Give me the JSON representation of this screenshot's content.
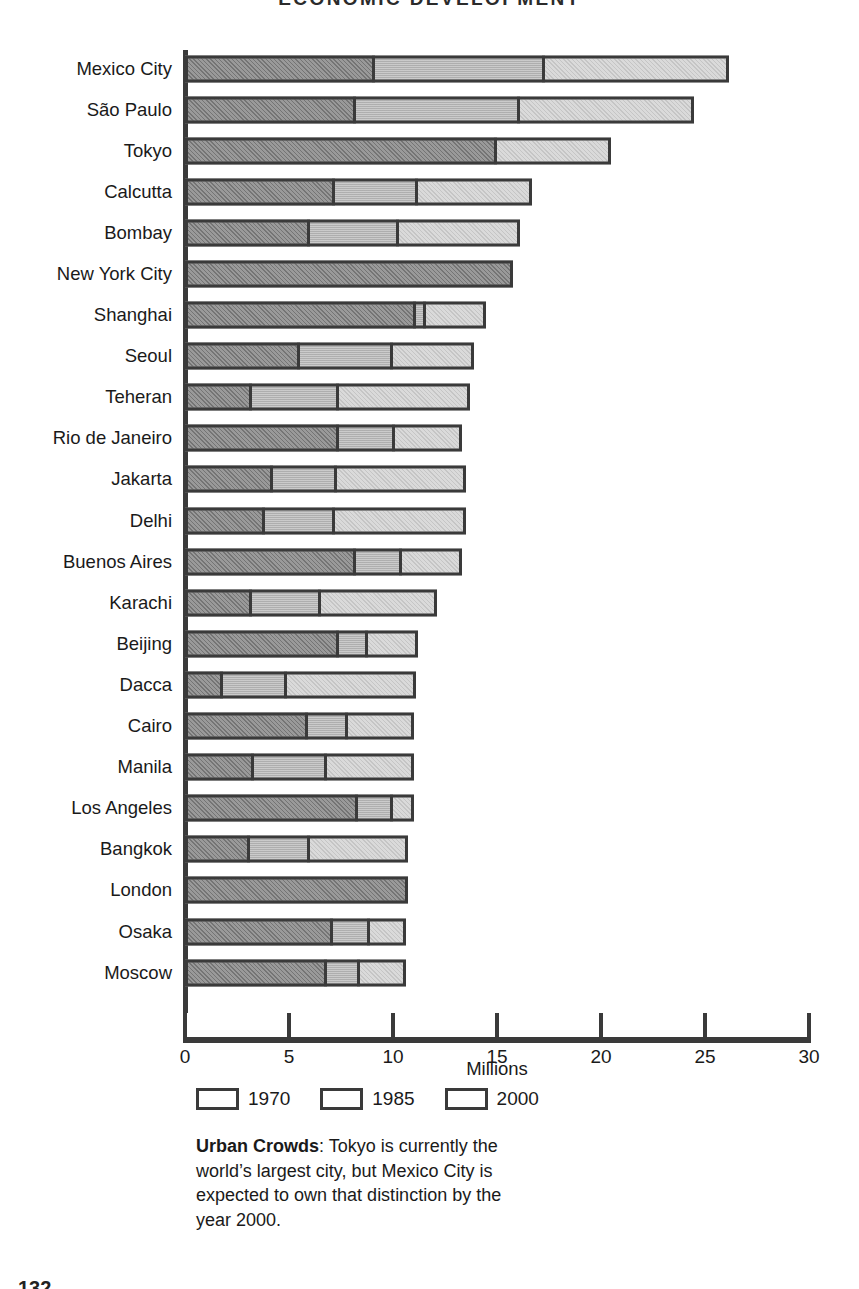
{
  "title": "ECONOMIC DEVELOPMENT",
  "page_number": "132",
  "axis": {
    "x_title": "Millions",
    "ticks": [
      0,
      5,
      10,
      15,
      20,
      25,
      30
    ],
    "min": 0,
    "max": 30
  },
  "legend": {
    "items": [
      {
        "label": "1970",
        "key": "s1970",
        "color": "#8e8e8e"
      },
      {
        "label": "1985",
        "key": "s1985",
        "color": "#c2c2c2"
      },
      {
        "label": "2000",
        "key": "s2000",
        "color": "#d4d4d4"
      }
    ]
  },
  "caption": {
    "lead": "Urban Crowds",
    "body": ": Tokyo is currently the world’s largest city, but Mexico City is expected to own that distinction by the year 2000."
  },
  "chart_data": {
    "type": "bar",
    "orientation": "horizontal",
    "stacked": true,
    "title": "ECONOMIC DEVELOPMENT",
    "xlabel": "Millions",
    "ylabel": "",
    "xlim": [
      0,
      30
    ],
    "xticks": [
      0,
      5,
      10,
      15,
      20,
      25,
      30
    ],
    "grid": false,
    "legend_position": "bottom",
    "note": "Values are cumulative population totals per year; segment widths are the increments between successive years.",
    "categories": [
      "Mexico City",
      "São Paulo",
      "Tokyo",
      "Calcutta",
      "Bombay",
      "New York City",
      "Shanghai",
      "Seoul",
      "Teheran",
      "Rio de Janeiro",
      "Jakarta",
      "Delhi",
      "Buenos Aires",
      "Karachi",
      "Beijing",
      "Dacca",
      "Cairo",
      "Manila",
      "Los Angeles",
      "Bangkok",
      "London",
      "Osaka",
      "Moscow"
    ],
    "series": [
      {
        "name": "1970",
        "values": [
          9.0,
          8.1,
          14.9,
          7.1,
          5.9,
          15.7,
          11.0,
          5.4,
          3.1,
          7.3,
          4.1,
          3.7,
          8.1,
          3.1,
          7.3,
          1.7,
          5.8,
          3.2,
          8.2,
          3.0,
          10.6,
          7.0,
          6.7
        ]
      },
      {
        "name": "1985",
        "values": [
          17.2,
          16.0,
          14.9,
          11.1,
          10.2,
          15.7,
          11.5,
          9.9,
          7.3,
          10.0,
          7.2,
          7.1,
          10.3,
          6.4,
          8.7,
          4.8,
          7.7,
          6.7,
          9.9,
          5.9,
          10.6,
          8.8,
          8.3
        ]
      },
      {
        "name": "2000",
        "values": [
          26.1,
          24.4,
          20.4,
          16.6,
          16.0,
          15.7,
          14.4,
          13.8,
          13.6,
          13.2,
          13.4,
          13.4,
          13.2,
          12.0,
          11.1,
          11.0,
          10.9,
          10.9,
          10.9,
          10.6,
          10.6,
          10.5,
          10.5
        ]
      }
    ]
  }
}
